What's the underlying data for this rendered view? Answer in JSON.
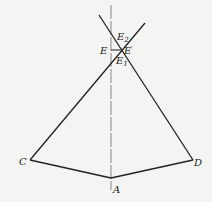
{
  "diagram": {
    "labels": {
      "E2": {
        "base": "E",
        "sub": "2"
      },
      "E": {
        "base": "E"
      },
      "Eprime": {
        "base": "E",
        "sup": "′"
      },
      "E1": {
        "base": "E",
        "sub": "1"
      },
      "C": {
        "base": "C"
      },
      "D": {
        "base": "D"
      },
      "A": {
        "base": "A"
      }
    },
    "colors": {
      "line": "#222222",
      "axis": "#888888",
      "background": "#f4f4f2"
    }
  }
}
